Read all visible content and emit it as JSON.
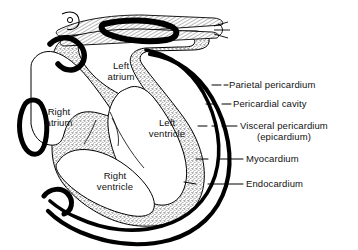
{
  "figure": {
    "line_color": "#000000",
    "text_color": "#111111",
    "myocardium_fill": "#d9d9d9",
    "chamber_fill": "#ffffff",
    "background": "#ffffff"
  },
  "chambers": [
    {
      "name": "left-atrium",
      "line1": "Left",
      "line2": "atrium",
      "x": 100,
      "y": 60
    },
    {
      "name": "right-atrium",
      "line1": "Right",
      "line2": "atrium",
      "x": 38,
      "y": 106
    },
    {
      "name": "left-ventricle",
      "line1": "Left",
      "line2": "ventricle",
      "x": 147,
      "y": 117
    },
    {
      "name": "right-ventricle",
      "line1": "Right",
      "line2": "ventricle",
      "x": 93,
      "y": 170
    }
  ],
  "callouts": [
    {
      "name": "parietal-pericardium",
      "label": "Parietal pericardium",
      "sub": "",
      "x": 229,
      "y": 78
    },
    {
      "name": "pericardial-cavity",
      "label": "Pericardial cavity",
      "sub": "",
      "x": 233,
      "y": 98
    },
    {
      "name": "visceral-pericardium",
      "label": "Visceral pericardium",
      "sub": "(epicardium)",
      "x": 240,
      "y": 120
    },
    {
      "name": "myocardium",
      "label": "Myocardium",
      "sub": "",
      "x": 246,
      "y": 152
    },
    {
      "name": "endocardium",
      "label": "Endocardium",
      "sub": "",
      "x": 246,
      "y": 177
    }
  ]
}
